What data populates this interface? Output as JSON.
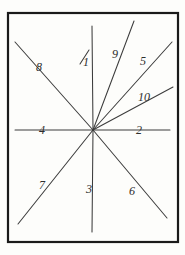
{
  "figure": {
    "paper_color": "#fdfdfb",
    "ink_color": "#3c3c3c",
    "border_color": "#1a1a1a",
    "center_point": {
      "x": 93,
      "y": 130
    },
    "border": {
      "x": 8,
      "y": 13,
      "width": 170,
      "height": 229
    },
    "rays": [
      {
        "id": "ray-1",
        "label": "1",
        "label_x": 83,
        "label_y": 56,
        "x1": 93,
        "y1": 130,
        "x2": 92,
        "y2": 26,
        "description": "vertical-up"
      },
      {
        "id": "ray-2",
        "label": "2",
        "label_x": 136,
        "label_y": 124,
        "x1": 93,
        "y1": 130,
        "x2": 170,
        "y2": 130,
        "description": "horizontal-right"
      },
      {
        "id": "ray-3",
        "label": "3",
        "label_x": 86,
        "label_y": 183,
        "x1": 93,
        "y1": 130,
        "x2": 92,
        "y2": 232,
        "description": "vertical-down"
      },
      {
        "id": "ray-4",
        "label": "4",
        "label_x": 39,
        "label_y": 124,
        "x1": 93,
        "y1": 130,
        "x2": 15,
        "y2": 130,
        "description": "horizontal-left"
      },
      {
        "id": "ray-5",
        "label": "5",
        "label_x": 140,
        "label_y": 55,
        "x1": 93,
        "y1": 130,
        "x2": 172,
        "y2": 42,
        "description": "upper-right-steep"
      },
      {
        "id": "ray-6",
        "label": "6",
        "label_x": 129,
        "label_y": 185,
        "x1": 93,
        "y1": 130,
        "x2": 167,
        "y2": 218,
        "description": "lower-right-diagonal"
      },
      {
        "id": "ray-7",
        "label": "7",
        "label_x": 39,
        "label_y": 179,
        "x1": 93,
        "y1": 130,
        "x2": 18,
        "y2": 224,
        "description": "lower-left-diagonal"
      },
      {
        "id": "ray-8",
        "label": "8",
        "label_x": 36,
        "label_y": 61,
        "x1": 93,
        "y1": 130,
        "x2": 15,
        "y2": 42,
        "description": "upper-left-diagonal"
      },
      {
        "id": "ray-9",
        "label": "9",
        "label_x": 112,
        "label_y": 48,
        "x1": 93,
        "y1": 130,
        "x2": 134,
        "y2": 21,
        "description": "upper-right-very-steep"
      },
      {
        "id": "ray-10",
        "label": "10",
        "label_x": 138,
        "label_y": 91,
        "x1": 93,
        "y1": 130,
        "x2": 173,
        "y2": 87,
        "description": "upper-right-shallow"
      }
    ]
  }
}
